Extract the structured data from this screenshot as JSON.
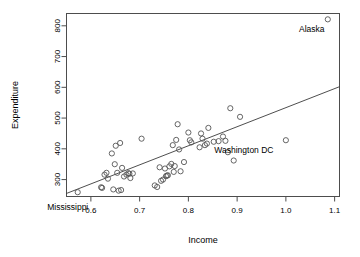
{
  "chart_data": {
    "type": "scatter",
    "title": "",
    "xlabel": "Income",
    "ylabel": "Expenditure",
    "xlim": [
      0.55,
      1.11
    ],
    "ylim": [
      245,
      840
    ],
    "grid": false,
    "legend": null,
    "xticks": [
      0.6,
      0.7,
      0.8,
      0.9,
      1.0,
      1.1
    ],
    "xtick_labels": [
      "0.6",
      "0.7",
      "0.8",
      "0.9",
      "1.0",
      "1.1"
    ],
    "yticks": [
      300,
      400,
      500,
      600,
      700,
      800
    ],
    "ytick_labels": [
      "300",
      "400",
      "500",
      "600",
      "700",
      "800"
    ],
    "points": [
      {
        "x": 0.573,
        "y": 259
      },
      {
        "x": 0.621,
        "y": 275
      },
      {
        "x": 0.623,
        "y": 273
      },
      {
        "x": 0.628,
        "y": 316
      },
      {
        "x": 0.632,
        "y": 322
      },
      {
        "x": 0.635,
        "y": 303
      },
      {
        "x": 0.643,
        "y": 385
      },
      {
        "x": 0.646,
        "y": 268
      },
      {
        "x": 0.649,
        "y": 350
      },
      {
        "x": 0.651,
        "y": 410
      },
      {
        "x": 0.654,
        "y": 322
      },
      {
        "x": 0.657,
        "y": 264
      },
      {
        "x": 0.66,
        "y": 419
      },
      {
        "x": 0.662,
        "y": 266
      },
      {
        "x": 0.664,
        "y": 338
      },
      {
        "x": 0.668,
        "y": 310
      },
      {
        "x": 0.673,
        "y": 316
      },
      {
        "x": 0.677,
        "y": 321
      },
      {
        "x": 0.679,
        "y": 319
      },
      {
        "x": 0.681,
        "y": 305
      },
      {
        "x": 0.686,
        "y": 320
      },
      {
        "x": 0.704,
        "y": 433
      },
      {
        "x": 0.731,
        "y": 281
      },
      {
        "x": 0.736,
        "y": 276
      },
      {
        "x": 0.741,
        "y": 340
      },
      {
        "x": 0.744,
        "y": 296
      },
      {
        "x": 0.748,
        "y": 300
      },
      {
        "x": 0.752,
        "y": 336
      },
      {
        "x": 0.754,
        "y": 311
      },
      {
        "x": 0.756,
        "y": 313
      },
      {
        "x": 0.758,
        "y": 314
      },
      {
        "x": 0.761,
        "y": 343
      },
      {
        "x": 0.765,
        "y": 351
      },
      {
        "x": 0.768,
        "y": 412
      },
      {
        "x": 0.77,
        "y": 325
      },
      {
        "x": 0.772,
        "y": 344
      },
      {
        "x": 0.775,
        "y": 429
      },
      {
        "x": 0.778,
        "y": 480
      },
      {
        "x": 0.781,
        "y": 398
      },
      {
        "x": 0.784,
        "y": 327
      },
      {
        "x": 0.791,
        "y": 357
      },
      {
        "x": 0.8,
        "y": 453
      },
      {
        "x": 0.803,
        "y": 428
      },
      {
        "x": 0.806,
        "y": 421
      },
      {
        "x": 0.823,
        "y": 405
      },
      {
        "x": 0.826,
        "y": 450
      },
      {
        "x": 0.829,
        "y": 433
      },
      {
        "x": 0.834,
        "y": 412
      },
      {
        "x": 0.838,
        "y": 417
      },
      {
        "x": 0.841,
        "y": 468
      },
      {
        "x": 0.852,
        "y": 423
      },
      {
        "x": 0.862,
        "y": 425
      },
      {
        "x": 0.871,
        "y": 440
      },
      {
        "x": 0.876,
        "y": 426
      },
      {
        "x": 0.881,
        "y": 389
      },
      {
        "x": 0.886,
        "y": 532
      },
      {
        "x": 0.893,
        "y": 362
      },
      {
        "x": 0.906,
        "y": 504
      },
      {
        "x": 1.0,
        "y": 428
      },
      {
        "x": 1.086,
        "y": 821
      }
    ],
    "fit_line": {
      "x_start": 0.55,
      "y_start": 255,
      "x_end": 1.11,
      "y_end": 602
    },
    "annotations": [
      {
        "label": "Alaska",
        "x": 1.086,
        "y": 821,
        "dx": -16,
        "dy": 13
      },
      {
        "label": "Washington DC",
        "x": 1.0,
        "y": 428,
        "dx": -42,
        "dy": 13
      },
      {
        "label": "Mississippi",
        "x": 0.573,
        "y": 259,
        "dx": -10,
        "dy": 18
      }
    ]
  }
}
